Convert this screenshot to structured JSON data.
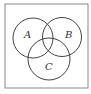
{
  "diagram": {
    "type": "venn",
    "sets": [
      {
        "label": "A",
        "cx": 33,
        "cy": 38,
        "r": 20
      },
      {
        "label": "B",
        "cx": 62,
        "cy": 37,
        "r": 19.5
      },
      {
        "label": "C",
        "cx": 49,
        "cy": 59,
        "r": 21
      }
    ],
    "frame": {
      "x": 5,
      "y": 4,
      "width": 83,
      "height": 84
    },
    "colors": {
      "stroke": "#444444",
      "frame": "#888888",
      "background": "#ffffff"
    }
  }
}
